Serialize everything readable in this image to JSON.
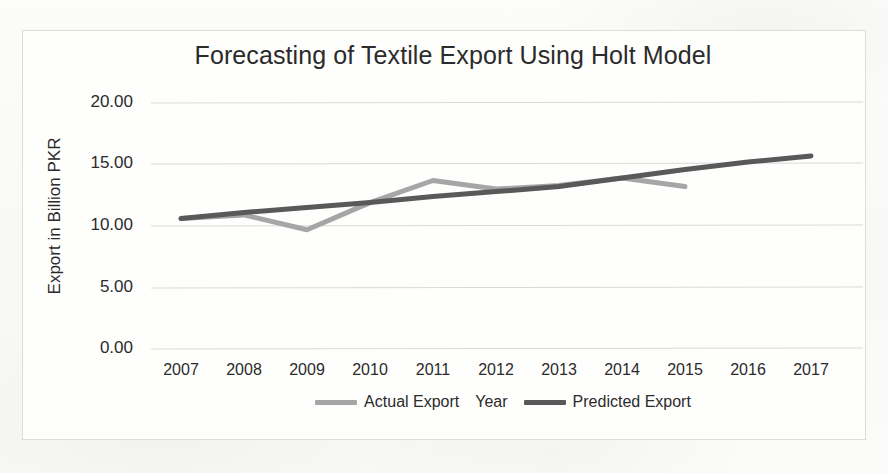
{
  "chart_data": {
    "type": "line",
    "title": "Forecasting of Textile Export Using Holt Model",
    "xlabel": "Year",
    "ylabel": "Export in Billion PKR",
    "categories": [
      "2007",
      "2008",
      "2009",
      "2010",
      "2011",
      "2012",
      "2013",
      "2014",
      "2015",
      "2016",
      "2017"
    ],
    "x": [
      2007,
      2008,
      2009,
      2010,
      2011,
      2012,
      2013,
      2014,
      2015,
      2016,
      2017
    ],
    "ylim": [
      0.0,
      20.0
    ],
    "ytick_labels": [
      "0.00",
      "5.00",
      "10.00",
      "15.00",
      "20.00"
    ],
    "ytick_values": [
      0.0,
      5.0,
      10.0,
      15.0,
      20.0
    ],
    "grid": true,
    "legend_position": "bottom",
    "series": [
      {
        "name": "Actual Export",
        "color": "#a6a6a6",
        "values": [
          10.6,
          10.9,
          9.7,
          11.9,
          13.7,
          13.0,
          13.3,
          13.9,
          13.2,
          null,
          null
        ]
      },
      {
        "name": "Predicted Export",
        "color": "#595959",
        "values": [
          10.6,
          11.1,
          11.5,
          11.9,
          12.4,
          12.8,
          13.2,
          13.9,
          14.6,
          15.2,
          15.7
        ]
      }
    ]
  },
  "legend": {
    "items": [
      {
        "label": "Actual Export",
        "color": "#a6a6a6"
      },
      {
        "label": "Predicted Export",
        "color": "#595959"
      }
    ]
  }
}
